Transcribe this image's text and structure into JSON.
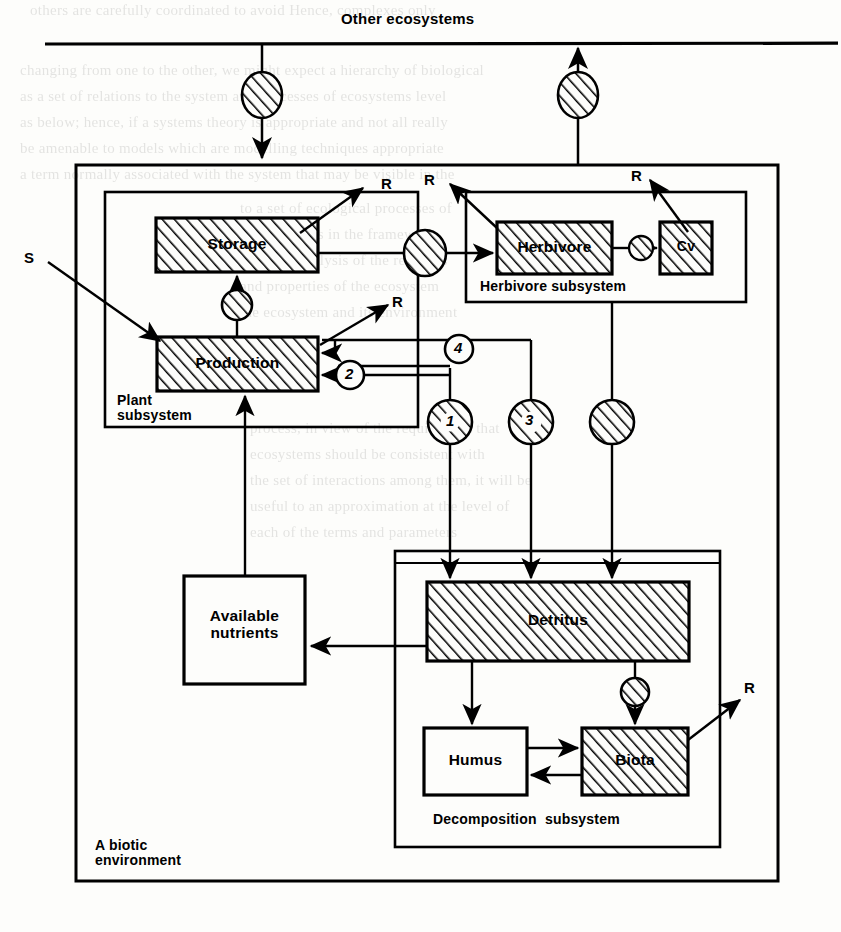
{
  "diagram": {
    "title": "Other ecosystems",
    "outer_label_line1": "A biotic",
    "outer_label_line2": "environment",
    "source_label": "S"
  },
  "subsystems": [
    {
      "id": "plant",
      "label": "Plant\nsubsystem"
    },
    {
      "id": "herbivore",
      "label": "Herbivore subsystem"
    },
    {
      "id": "decomposition",
      "label": "Decomposition  subsystem"
    }
  ],
  "compartments": [
    {
      "id": "storage",
      "label": "Storage",
      "hatched": true
    },
    {
      "id": "production",
      "label": "Production",
      "hatched": true
    },
    {
      "id": "herbivore",
      "label": "Herbivore",
      "hatched": true
    },
    {
      "id": "cv",
      "label": "Cv",
      "hatched": true
    },
    {
      "id": "available_nutrients",
      "label": "Available\nnutrients",
      "hatched": false
    },
    {
      "id": "detritus",
      "label": "Detritus",
      "hatched": true
    },
    {
      "id": "humus",
      "label": "Humus",
      "hatched": false
    },
    {
      "id": "biota",
      "label": "Biota",
      "hatched": true
    }
  ],
  "respiration_labels": [
    {
      "id": "r-storage",
      "label": "R"
    },
    {
      "id": "r-production",
      "label": "R"
    },
    {
      "id": "r-herbivore",
      "label": "R"
    },
    {
      "id": "r-cv",
      "label": "R"
    },
    {
      "id": "r-biota",
      "label": "R"
    }
  ],
  "flow_numbers": [
    {
      "id": "flow-1",
      "label": "1",
      "style": "hatched-circle"
    },
    {
      "id": "flow-2",
      "label": "2",
      "style": "open-circle"
    },
    {
      "id": "flow-3",
      "label": "3",
      "style": "hatched-circle"
    },
    {
      "id": "flow-4",
      "label": "4",
      "style": "open-circle"
    }
  ],
  "valves": [
    {
      "id": "valve-import",
      "shape": "ellipse",
      "numbered": false
    },
    {
      "id": "valve-export",
      "shape": "ellipse",
      "numbered": false
    },
    {
      "id": "valve-storage",
      "shape": "circle",
      "numbered": false
    },
    {
      "id": "valve-grazing",
      "shape": "circle",
      "numbered": false
    },
    {
      "id": "valve-herbivore-cv",
      "shape": "circle",
      "numbered": false
    },
    {
      "id": "valve-herbivore-detritus",
      "shape": "circle",
      "numbered": false
    },
    {
      "id": "valve-detritus-biota",
      "shape": "circle",
      "numbered": false
    }
  ],
  "colors": {
    "ink": "#000000",
    "paper": "#fdfdfb"
  },
  "background_text": [
    {
      "x": 30,
      "y": 2,
      "t": "others are carefully coordinated to avoid   Hence, complexes only"
    },
    {
      "x": 20,
      "y": 62,
      "t": "changing from one to the other, we might expect a hierarchy of biological"
    },
    {
      "x": 20,
      "y": 88,
      "t": "as a set of relations to the system and processes of ecosystems level"
    },
    {
      "x": 20,
      "y": 114,
      "t": "as below; hence, if a systems theory is appropriate and not all   really"
    },
    {
      "x": 20,
      "y": 140,
      "t": "be amenable to models which are modelling techniques appropriate"
    },
    {
      "x": 20,
      "y": 166,
      "t": "a term normally associated with the system that may be visible in the"
    },
    {
      "x": 240,
      "y": 200,
      "t": "to a set of ecological processes of"
    },
    {
      "x": 240,
      "y": 226,
      "t": "the system as in the framework"
    },
    {
      "x": 240,
      "y": 252,
      "t": "a further analysis of the relations"
    },
    {
      "x": 240,
      "y": 278,
      "t": "and properties of the ecosystem"
    },
    {
      "x": 240,
      "y": 304,
      "t": "the ecosystem and its environment"
    },
    {
      "x": 250,
      "y": 420,
      "t": "process, in view of the requirement that"
    },
    {
      "x": 250,
      "y": 446,
      "t": "ecosystems should be consistent with"
    },
    {
      "x": 250,
      "y": 472,
      "t": "the set of interactions among them, it will be"
    },
    {
      "x": 250,
      "y": 498,
      "t": "useful to an approximation at the level of"
    },
    {
      "x": 250,
      "y": 524,
      "t": "each of the terms and parameters"
    }
  ]
}
